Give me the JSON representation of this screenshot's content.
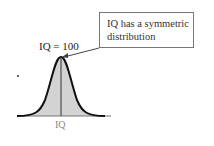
{
  "callout": {
    "line1": "IQ has a symmetric",
    "line2": "distribution"
  },
  "peak_label": "IQ = 100",
  "axis_label": "IQ",
  "colors": {
    "fill": "#d3d3d3",
    "curve": "#111111",
    "box_border": "#777777"
  }
}
